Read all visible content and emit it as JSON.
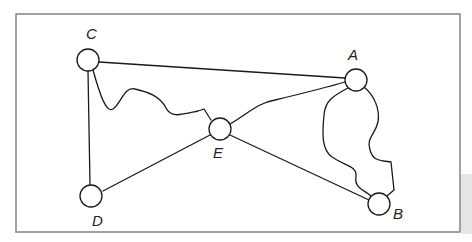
{
  "diagram": {
    "type": "graph",
    "nodes": [
      {
        "id": "A",
        "label": "A",
        "cx": 356,
        "cy": 80,
        "lx": 352,
        "ly": 60
      },
      {
        "id": "B",
        "label": "B",
        "cx": 379,
        "cy": 204,
        "lx": 393,
        "ly": 218
      },
      {
        "id": "C",
        "label": "C",
        "cx": 88,
        "cy": 60,
        "lx": 86,
        "ly": 39
      },
      {
        "id": "D",
        "label": "D",
        "cx": 93,
        "cy": 196,
        "lx": 92,
        "ly": 226
      },
      {
        "id": "E",
        "label": "E",
        "cx": 220,
        "cy": 129,
        "lx": 214,
        "ly": 158
      }
    ],
    "edges": [
      {
        "from": "C",
        "to": "A",
        "style": "straight"
      },
      {
        "from": "C",
        "to": "D",
        "style": "straight"
      },
      {
        "from": "C",
        "to": "E",
        "style": "wavy"
      },
      {
        "from": "E",
        "to": "A",
        "style": "curved"
      },
      {
        "from": "E",
        "to": "D",
        "style": "straight"
      },
      {
        "from": "E",
        "to": "B",
        "style": "straight"
      },
      {
        "from": "A",
        "to": "B",
        "style": "wavy-left"
      },
      {
        "from": "A",
        "to": "B",
        "style": "wavy-right"
      }
    ]
  }
}
